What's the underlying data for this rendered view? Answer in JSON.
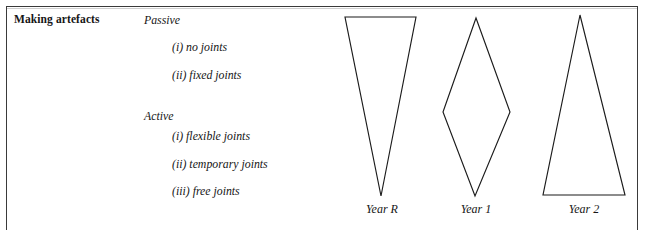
{
  "figure": {
    "heading": "Making artefacts",
    "groups": [
      {
        "label": "Passive",
        "items": [
          "(i) no joints",
          "(ii) fixed joints"
        ]
      },
      {
        "label": "Active",
        "items": [
          "(i) flexible joints",
          "(ii) temporary joints",
          "(iii) free joints"
        ]
      }
    ],
    "shapes": [
      {
        "name": "inverted-triangle",
        "label": "Year R",
        "points": "345,17 416,17 381,196"
      },
      {
        "name": "diamond",
        "label": "Year 1",
        "points": "476,18 510,112 475,196 443,112"
      },
      {
        "name": "upright-triangle",
        "label": "Year 2",
        "points": "580,15 625,195 543,195"
      }
    ],
    "colors": {
      "ink": "#1b1b1b",
      "frame": "#3a3a3a",
      "background": "#ffffff"
    }
  }
}
